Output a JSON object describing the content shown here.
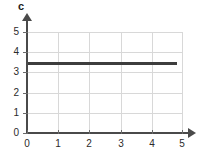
{
  "chart_data": {
    "type": "line",
    "title": "",
    "subtitle": "",
    "xlabel": "",
    "ylabel": "c",
    "xlim": [
      0,
      5
    ],
    "ylim": [
      0,
      5
    ],
    "grid": true,
    "legend": false,
    "x_ticks": [
      "0",
      "1",
      "2",
      "3",
      "4",
      "5"
    ],
    "y_ticks": [
      "0",
      "1",
      "2",
      "3",
      "4",
      "5"
    ],
    "x_tick_values": [
      0,
      1,
      2,
      3,
      4,
      5
    ],
    "y_tick_values": [
      0,
      1,
      2,
      3,
      4,
      5
    ],
    "series": [
      {
        "name": "c",
        "x": [
          0,
          4.8
        ],
        "values": [
          3.45,
          3.45
        ],
        "color": "#3d3d3d",
        "constant_value": 3.45
      }
    ],
    "annotations": []
  },
  "axes": {
    "y_axis_label": "c",
    "x_arrow": "arrow-right",
    "y_arrow": "arrow-up"
  },
  "colors": {
    "series": "#3d3d3d",
    "axis": "#4a4a4a",
    "grid": "#d8d8d8",
    "text": "#2b2b2b",
    "background": "#ffffff"
  }
}
